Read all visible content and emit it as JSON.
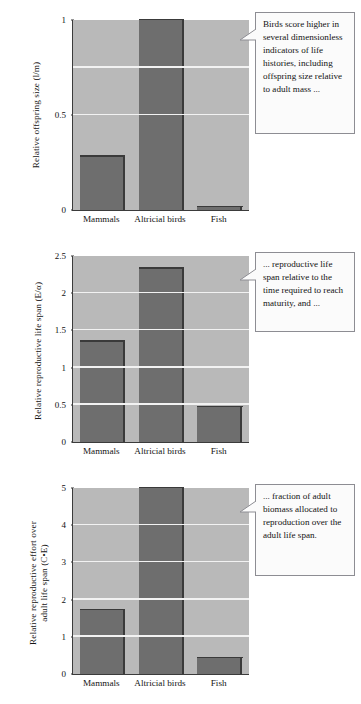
{
  "figure": {
    "categories": [
      "Mammals",
      "Altricial birds",
      "Fish"
    ],
    "bar_color": "#6e6e6e",
    "bar_edge_color": "#3a3a3a",
    "plot_background": "#b9b9b9",
    "gridline_color": "#f2f2f2"
  },
  "panels": [
    {
      "id": "panel-offspring-size",
      "ylabel": "Relative offspring size (l/m)",
      "ticks": [
        "0",
        "0.5",
        "1"
      ],
      "tick_values": [
        0,
        0.5,
        1
      ],
      "gridlines": [
        0.5,
        0.75
      ],
      "ylim": [
        0,
        1
      ],
      "values": [
        0.28,
        1.0,
        0.015
      ],
      "callout": "Birds score higher in several dimensionless indicators of life histories, including offspring size relative to adult mass ..."
    },
    {
      "id": "panel-reproductive-life-span",
      "ylabel": "Relative reproductive life span (E/α)",
      "ticks": [
        "0",
        "0.5",
        "1",
        "1.5",
        "2",
        "2.5"
      ],
      "tick_values": [
        0,
        0.5,
        1,
        1.5,
        2,
        2.5
      ],
      "gridlines": [
        0.5,
        1,
        1.5,
        2
      ],
      "ylim": [
        0,
        2.5
      ],
      "values": [
        1.35,
        2.33,
        0.47
      ],
      "callout": "... reproductive life span relative to the time required to reach maturity, and ..."
    },
    {
      "id": "panel-reproductive-effort",
      "ylabel": "Relative reproductive effort over\nadult life span (C•E)",
      "ticks": [
        "0",
        "1",
        "2",
        "3",
        "4",
        "5"
      ],
      "tick_values": [
        0,
        1,
        2,
        3,
        4,
        5
      ],
      "gridlines": [
        1,
        2,
        3,
        4
      ],
      "ylim": [
        0,
        5
      ],
      "values": [
        1.72,
        5.0,
        0.42
      ],
      "callout": "... fraction of adult biomass allocated to reproduction over the adult life span."
    }
  ],
  "chart_data": [
    {
      "type": "bar",
      "title": "",
      "xlabel": "",
      "ylabel": "Relative offspring size (l/m)",
      "categories": [
        "Mammals",
        "Altricial birds",
        "Fish"
      ],
      "values": [
        0.28,
        1.0,
        0.015
      ],
      "ylim": [
        0,
        1
      ],
      "yticks": [
        0,
        0.5,
        1
      ],
      "grid": true,
      "legend": "none",
      "annotation": "Birds score higher in several dimensionless indicators of life histories, including offspring size relative to adult mass ..."
    },
    {
      "type": "bar",
      "title": "",
      "xlabel": "",
      "ylabel": "Relative reproductive life span (E/α)",
      "categories": [
        "Mammals",
        "Altricial birds",
        "Fish"
      ],
      "values": [
        1.35,
        2.33,
        0.47
      ],
      "ylim": [
        0,
        2.5
      ],
      "yticks": [
        0,
        0.5,
        1,
        1.5,
        2,
        2.5
      ],
      "grid": true,
      "legend": "none",
      "annotation": "... reproductive life span relative to the time required to reach maturity, and ..."
    },
    {
      "type": "bar",
      "title": "",
      "xlabel": "",
      "ylabel": "Relative reproductive effort over adult life span (C•E)",
      "categories": [
        "Mammals",
        "Altricial birds",
        "Fish"
      ],
      "values": [
        1.72,
        5.0,
        0.42
      ],
      "ylim": [
        0,
        5
      ],
      "yticks": [
        0,
        1,
        2,
        3,
        4,
        5
      ],
      "grid": true,
      "legend": "none",
      "annotation": "... fraction of adult biomass allocated to reproduction over the adult life span."
    }
  ]
}
